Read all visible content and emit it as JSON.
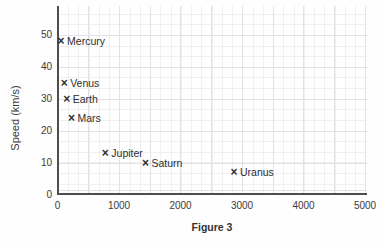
{
  "figure": {
    "caption": "Figure 3"
  },
  "chart_data": {
    "type": "scatter",
    "title": "",
    "xlabel": "",
    "ylabel": "Speed (km/s)",
    "xlim": [
      0,
      5000
    ],
    "ylim": [
      0,
      59
    ],
    "grid": true,
    "legend": false,
    "marker": "×",
    "xticks": [
      0,
      1000,
      2000,
      3000,
      4000,
      5000
    ],
    "yticks": [
      0,
      10,
      20,
      30,
      40,
      50
    ],
    "points": [
      {
        "label": "Mercury",
        "x": 58,
        "y": 48
      },
      {
        "label": "Venus",
        "x": 108,
        "y": 35
      },
      {
        "label": "Earth",
        "x": 150,
        "y": 30
      },
      {
        "label": "Mars",
        "x": 228,
        "y": 24
      },
      {
        "label": "Jupiter",
        "x": 778,
        "y": 13
      },
      {
        "label": "Saturn",
        "x": 1430,
        "y": 10
      },
      {
        "label": "Uranus",
        "x": 2870,
        "y": 7
      }
    ]
  }
}
